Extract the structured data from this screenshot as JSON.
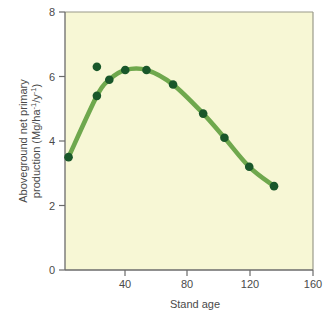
{
  "chart_data": {
    "type": "line",
    "title": "",
    "xlabel": "Stand age",
    "ylabel_line1": "Aboveground net primary",
    "ylabel_line2_pre": "production (Mg/ha",
    "ylabel_sup1": "-1",
    "ylabel_mid": "/y",
    "ylabel_sup2": "-1",
    "ylabel_post": ")",
    "xlim": [
      20,
      160
    ],
    "ylim": [
      0,
      8
    ],
    "xticks": [
      40,
      80,
      120,
      160
    ],
    "yticks": [
      0,
      2,
      4,
      6,
      8
    ],
    "grid": false,
    "legend": "none",
    "series": [
      {
        "name": "Aboveground net primary production",
        "line_color": "#6fa84d",
        "marker_color": "#19572a",
        "points": [
          {
            "x": 22,
            "y": 3.5,
            "on_curve": true
          },
          {
            "x": 38,
            "y": 5.4,
            "on_curve": true
          },
          {
            "x": 38,
            "y": 6.3,
            "on_curve": false
          },
          {
            "x": 45,
            "y": 5.9,
            "on_curve": true
          },
          {
            "x": 54,
            "y": 6.2,
            "on_curve": true
          },
          {
            "x": 66,
            "y": 6.2,
            "on_curve": true
          },
          {
            "x": 81,
            "y": 5.75,
            "on_curve": true
          },
          {
            "x": 98,
            "y": 4.85,
            "on_curve": true
          },
          {
            "x": 110,
            "y": 4.1,
            "on_curve": true
          },
          {
            "x": 124,
            "y": 3.2,
            "on_curve": true
          },
          {
            "x": 138,
            "y": 2.6,
            "on_curve": true
          }
        ]
      }
    ]
  },
  "style": {
    "plot_background": "#f7f7d5",
    "frame_color": "#8a8a7a",
    "text_color": "#4a4a4a",
    "page_background": "#ffffff"
  }
}
